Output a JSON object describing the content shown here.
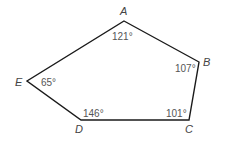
{
  "diagram": {
    "type": "pentagon",
    "stroke_color": "#1a1a1a",
    "vertices": [
      {
        "name": "A",
        "angle": "121°"
      },
      {
        "name": "B",
        "angle": "107°"
      },
      {
        "name": "C",
        "angle": "101°"
      },
      {
        "name": "D",
        "angle": "146°"
      },
      {
        "name": "E",
        "angle": "65°"
      }
    ]
  }
}
